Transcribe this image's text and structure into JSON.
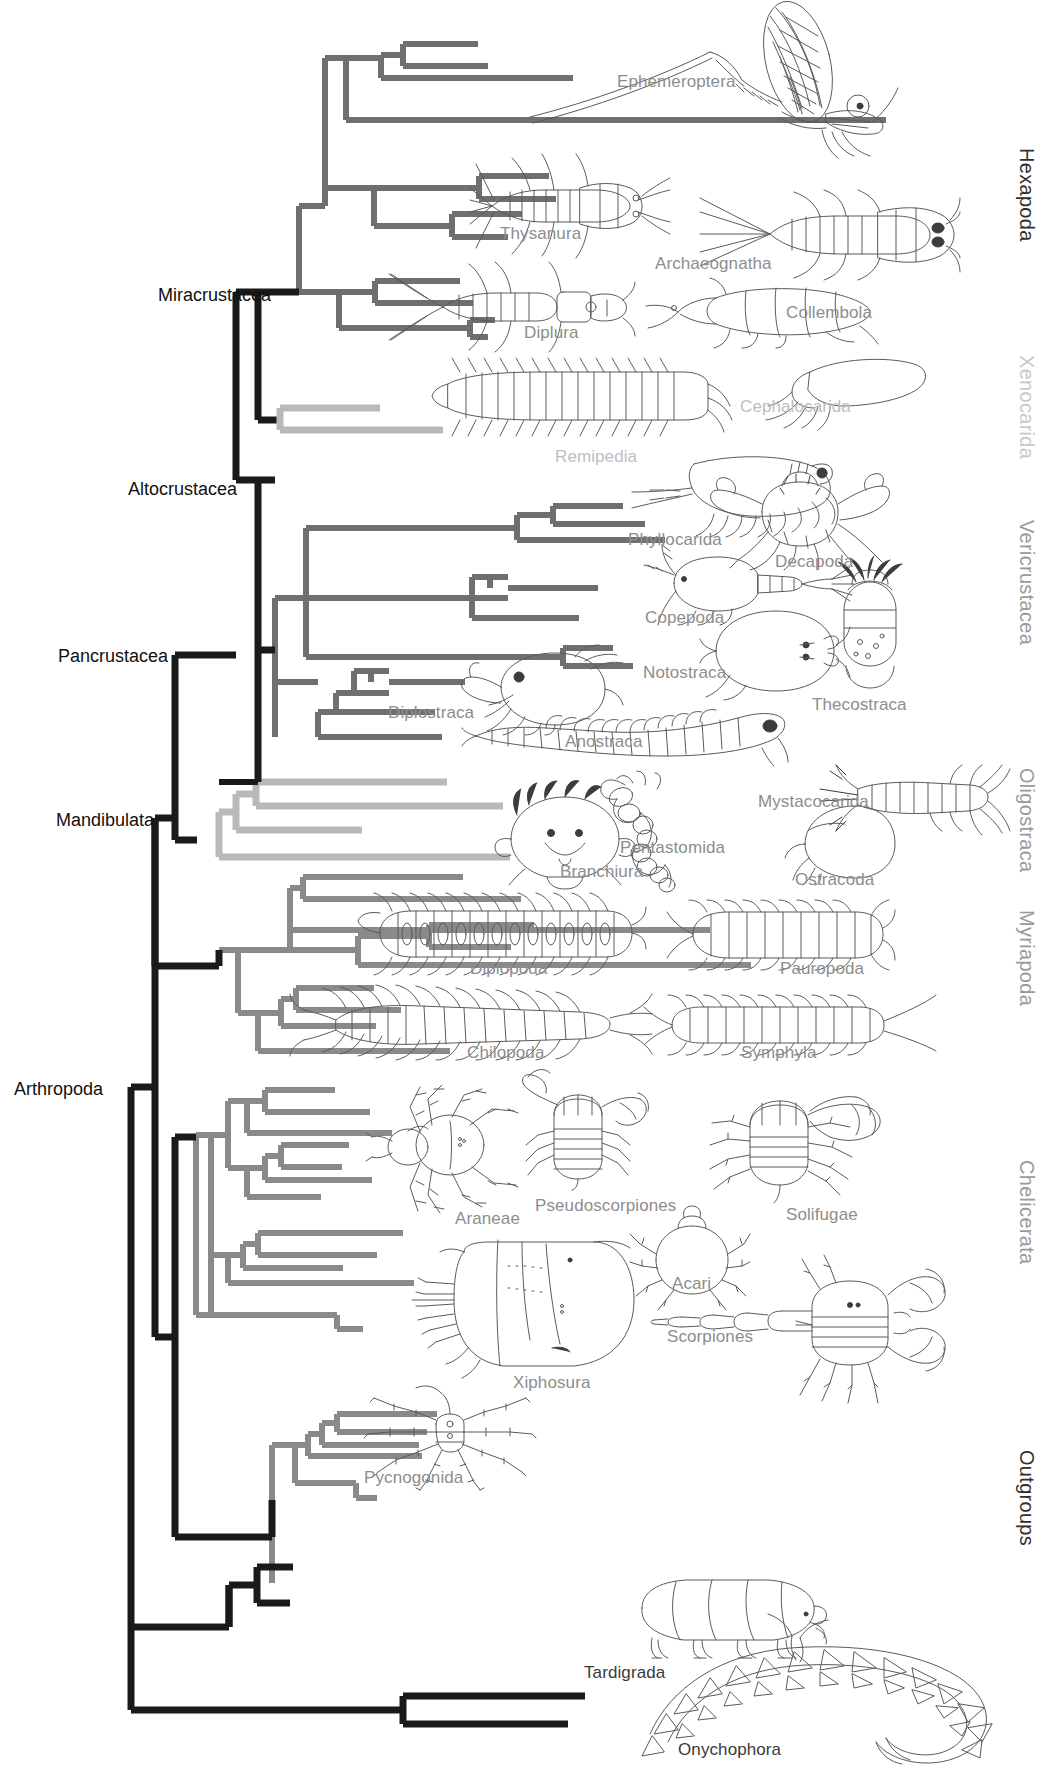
{
  "figure": {
    "type": "phylogenetic-tree",
    "background_color": "#ffffff",
    "branch_colors": {
      "black": "#1a1a1a",
      "gray": "#6f6f6f",
      "light_gray": "#b9b9b9",
      "mid_gray": "#8a8a8a"
    }
  },
  "clade_labels": [
    {
      "id": "miracrustacea",
      "text": "Miracrustacea",
      "x": 158,
      "y": 285,
      "color": "#111111"
    },
    {
      "id": "altocrustacea",
      "text": "Altocrustacea",
      "x": 128,
      "y": 479,
      "color": "#111111"
    },
    {
      "id": "pancrustacea",
      "text": "Pancrustacea",
      "x": 58,
      "y": 646,
      "color": "#111111"
    },
    {
      "id": "mandibulata",
      "text": "Mandibulata",
      "x": 56,
      "y": 810,
      "color": "#111111"
    },
    {
      "id": "arthropoda",
      "text": "Arthropoda",
      "x": 14,
      "y": 1079,
      "color": "#111111"
    }
  ],
  "group_labels": [
    {
      "id": "hexapoda",
      "text": "Hexapoda",
      "tone": "dark",
      "x": 1038,
      "y": 148,
      "height": 190
    },
    {
      "id": "xenocarida",
      "text": "Xenocarida",
      "tone": "faint",
      "x": 1038,
      "y": 355,
      "height": 120
    },
    {
      "id": "vericrustacea",
      "text": "Vericrustacea",
      "tone": "mid",
      "x": 1038,
      "y": 520,
      "height": 200
    },
    {
      "id": "oligostraca",
      "text": "Oligostraca",
      "tone": "mid",
      "x": 1038,
      "y": 768,
      "height": 140
    },
    {
      "id": "myriapoda",
      "text": "Myriapoda",
      "tone": "mid",
      "x": 1038,
      "y": 910,
      "height": 140
    },
    {
      "id": "chelicerata",
      "text": "Chelicerata",
      "tone": "mid",
      "x": 1038,
      "y": 1160,
      "height": 150
    },
    {
      "id": "outgroups",
      "text": "Outgroups",
      "tone": "dark",
      "x": 1038,
      "y": 1450,
      "height": 130
    }
  ],
  "taxa": [
    {
      "id": "ephemeroptera",
      "text": "Ephemeroptera",
      "x": 617,
      "y": 72,
      "tone": "gray"
    },
    {
      "id": "thysanura",
      "text": "Thysanura",
      "x": 500,
      "y": 224,
      "tone": "gray"
    },
    {
      "id": "archaeognatha",
      "text": "Archaeognatha",
      "x": 655,
      "y": 254,
      "tone": "gray"
    },
    {
      "id": "diplura",
      "text": "Diplura",
      "x": 524,
      "y": 323,
      "tone": "gray"
    },
    {
      "id": "collembola",
      "text": "Collembola",
      "x": 786,
      "y": 303,
      "tone": "gray"
    },
    {
      "id": "cephalocarida",
      "text": "Cephalocarida",
      "x": 740,
      "y": 397,
      "tone": "faint"
    },
    {
      "id": "remipedia",
      "text": "Remipedia",
      "x": 555,
      "y": 447,
      "tone": "faint"
    },
    {
      "id": "phyllocarida",
      "text": "Phyllocarida",
      "x": 628,
      "y": 530,
      "tone": "gray"
    },
    {
      "id": "decapoda",
      "text": "Decapoda",
      "x": 775,
      "y": 552,
      "tone": "gray"
    },
    {
      "id": "copepoda",
      "text": "Copepoda",
      "x": 645,
      "y": 608,
      "tone": "gray"
    },
    {
      "id": "notostraca",
      "text": "Notostraca",
      "x": 643,
      "y": 663,
      "tone": "gray"
    },
    {
      "id": "thecostraca",
      "text": "Thecostraca",
      "x": 812,
      "y": 695,
      "tone": "gray"
    },
    {
      "id": "diplostraca",
      "text": "Diplostraca",
      "x": 388,
      "y": 703,
      "tone": "gray"
    },
    {
      "id": "anostraca",
      "text": "Anostraca",
      "x": 565,
      "y": 732,
      "tone": "gray"
    },
    {
      "id": "mystacocarida",
      "text": "Mystacocarida",
      "x": 758,
      "y": 792,
      "tone": "gray"
    },
    {
      "id": "pentastomida",
      "text": "Pentastomida",
      "x": 620,
      "y": 838,
      "tone": "gray"
    },
    {
      "id": "branchiura",
      "text": "Branchiura",
      "x": 560,
      "y": 862,
      "tone": "gray"
    },
    {
      "id": "ostracoda",
      "text": "Ostracoda",
      "x": 795,
      "y": 870,
      "tone": "gray"
    },
    {
      "id": "diplopoda",
      "text": "Diplopoda",
      "x": 470,
      "y": 959,
      "tone": "gray"
    },
    {
      "id": "pauropoda",
      "text": "Pauropoda",
      "x": 780,
      "y": 959,
      "tone": "gray"
    },
    {
      "id": "chilopoda",
      "text": "Chilopoda",
      "x": 467,
      "y": 1043,
      "tone": "gray"
    },
    {
      "id": "symphyla",
      "text": "Symphyla",
      "x": 741,
      "y": 1043,
      "tone": "gray"
    },
    {
      "id": "araneae",
      "text": "Araneae",
      "x": 455,
      "y": 1209,
      "tone": "gray"
    },
    {
      "id": "pseudoscorpiones",
      "text": "Pseudoscorpiones",
      "x": 535,
      "y": 1196,
      "tone": "gray"
    },
    {
      "id": "solifugae",
      "text": "Solifugae",
      "x": 786,
      "y": 1205,
      "tone": "gray"
    },
    {
      "id": "acari",
      "text": "Acari",
      "x": 672,
      "y": 1274,
      "tone": "gray"
    },
    {
      "id": "scorpiones",
      "text": "Scorpiones",
      "x": 667,
      "y": 1327,
      "tone": "gray"
    },
    {
      "id": "xiphosura",
      "text": "Xiphosura",
      "x": 513,
      "y": 1373,
      "tone": "gray"
    },
    {
      "id": "pycnogonida",
      "text": "Pycnogonida",
      "x": 364,
      "y": 1468,
      "tone": "gray"
    },
    {
      "id": "tardigrada",
      "text": "Tardigrada",
      "x": 584,
      "y": 1663,
      "tone": "dark"
    },
    {
      "id": "onychophora",
      "text": "Onychophora",
      "x": 678,
      "y": 1740,
      "tone": "dark"
    }
  ],
  "chart_data": {
    "type": "tree",
    "root_label": "Arthropoda",
    "named_clades": [
      "Arthropoda",
      "Mandibulata",
      "Pancrustacea",
      "Altocrustacea",
      "Miracrustacea"
    ],
    "major_groups": [
      "Hexapoda",
      "Xenocarida",
      "Vericrustacea",
      "Oligostraca",
      "Myriapoda",
      "Chelicerata",
      "Outgroups"
    ],
    "terminal_taxa": [
      "Ephemeroptera",
      "Thysanura",
      "Archaeognatha",
      "Diplura",
      "Collembola",
      "Cephalocarida",
      "Remipedia",
      "Phyllocarida",
      "Decapoda",
      "Copepoda",
      "Notostraca",
      "Thecostraca",
      "Diplostraca",
      "Anostraca",
      "Mystacocarida",
      "Pentastomida",
      "Branchiura",
      "Ostracoda",
      "Diplopoda",
      "Pauropoda",
      "Chilopoda",
      "Symphyla",
      "Araneae",
      "Pseudoscorpiones",
      "Solifugae",
      "Acari",
      "Scorpiones",
      "Xiphosura",
      "Pycnogonida",
      "Tardigrada",
      "Onychophora"
    ],
    "grid": false,
    "legend": "none"
  }
}
